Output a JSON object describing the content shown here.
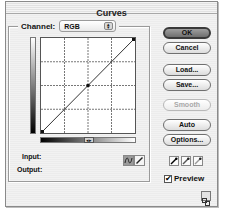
{
  "window": {
    "title": "Curves"
  },
  "channel": {
    "label": "Channel:",
    "value": "RGB",
    "arrows_glyph": "▴▾"
  },
  "curve": {
    "grid_divisions": 4,
    "points": [
      {
        "input": 0,
        "output": 0
      },
      {
        "input": 128,
        "output": 128
      },
      {
        "input": 255,
        "output": 255
      }
    ],
    "gradient_toggle_glyph": "◂▸"
  },
  "readout": {
    "input_label": "Input:",
    "input_value": "",
    "output_label": "Output:",
    "output_value": ""
  },
  "tools": {
    "curve_tool": "curve-point-icon",
    "pencil_tool": "pencil-icon",
    "selected": "curve_tool"
  },
  "buttons": {
    "ok": "OK",
    "cancel": "Cancel",
    "load": "Load...",
    "save": "Save...",
    "smooth": "Smooth",
    "auto": "Auto",
    "options": "Options..."
  },
  "eyedroppers": [
    {
      "name": "black-point-eyedropper"
    },
    {
      "name": "gray-point-eyedropper"
    },
    {
      "name": "white-point-eyedropper"
    }
  ],
  "preview": {
    "label": "Preview",
    "checked": true,
    "check_glyph": "✔"
  }
}
